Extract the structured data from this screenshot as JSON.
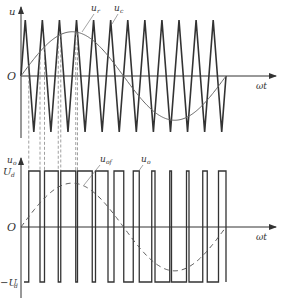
{
  "figure": {
    "top_plot": {
      "y_axis_label": "u",
      "x_axis_label": "ωt",
      "origin_label": "O",
      "carrier_label": "u_c",
      "reference_label": "u_r",
      "carrier_label_main": "u",
      "carrier_label_sub": "c",
      "reference_label_main": "u",
      "reference_label_sub": "r"
    },
    "bottom_plot": {
      "y_axis_label_main": "u",
      "y_axis_label_sub": "o",
      "x_axis_label": "ωt",
      "origin_label": "O",
      "positive_level_main": "U",
      "positive_level_sub": "d",
      "negative_level_main": "−U",
      "negative_level_sub": "d",
      "output_label_main": "u",
      "output_label_sub": "o",
      "fundamental_label_main": "u",
      "fundamental_label_sub": "of"
    },
    "colors": {
      "stroke": "#333333",
      "reference": "#555555"
    }
  },
  "chart_data": {
    "type": "line",
    "carrier_cycles": 12,
    "modulation_index": 0.79,
    "reference_periods": 1,
    "levels": {
      "high": "Ud",
      "low": "-Ud"
    }
  }
}
